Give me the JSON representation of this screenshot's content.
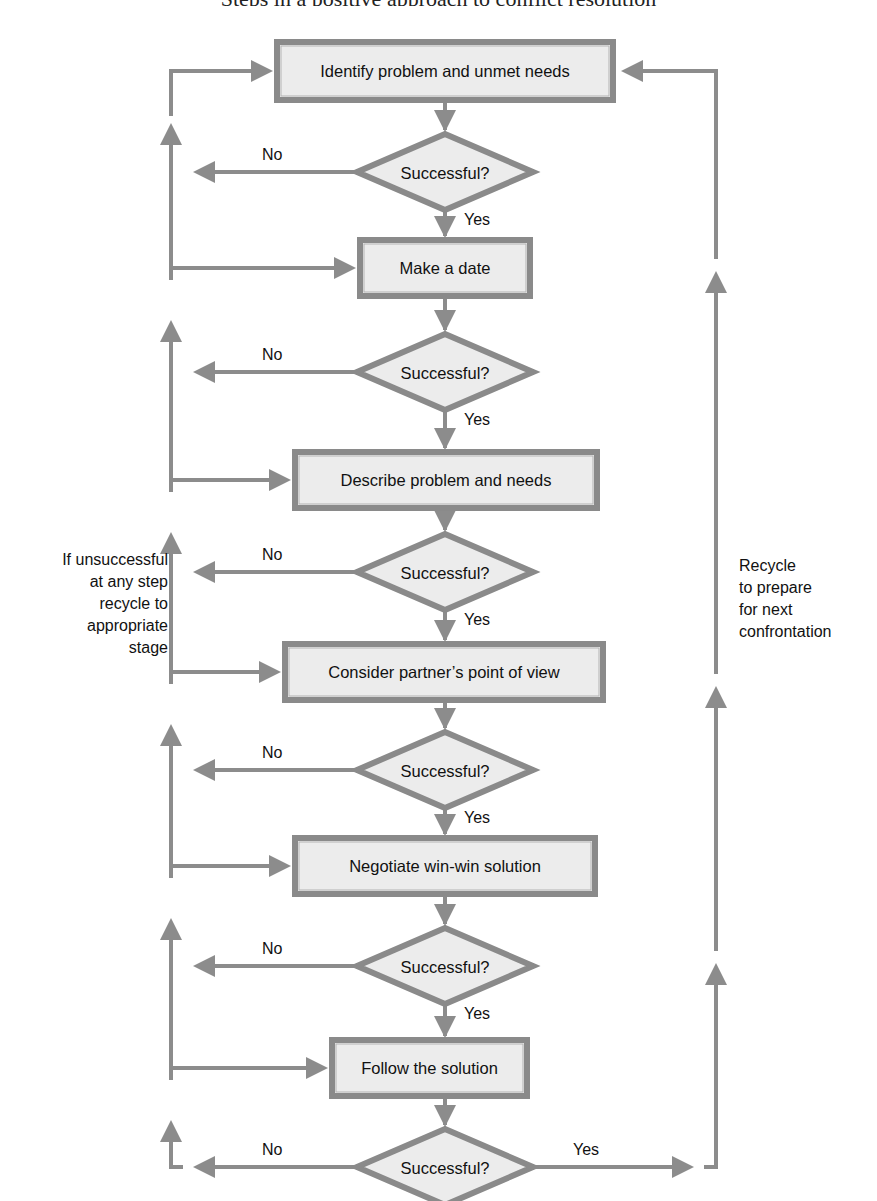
{
  "colors": {
    "box_fill": "#ececec",
    "box_border": "#8a8a8a",
    "connector": "#8c8c8c",
    "text": "#111111",
    "background": "#ffffff"
  },
  "caption_fragment": "Steps in a positive approach to conflict resolution",
  "steps": [
    {
      "id": "identify",
      "label": "Identify problem and unmet needs",
      "x": 277,
      "y": 42,
      "w": 336,
      "h": 58
    },
    {
      "id": "date",
      "label": "Make a date",
      "x": 360,
      "y": 240,
      "w": 170,
      "h": 56
    },
    {
      "id": "describe",
      "label": "Describe problem and needs",
      "x": 295,
      "y": 452,
      "w": 302,
      "h": 56
    },
    {
      "id": "consider",
      "label": "Consider partner’s point of view",
      "x": 285,
      "y": 644,
      "w": 318,
      "h": 56
    },
    {
      "id": "negotiate",
      "label": "Negotiate win-win solution",
      "x": 295,
      "y": 838,
      "w": 300,
      "h": 56
    },
    {
      "id": "follow",
      "label": "Follow the solution",
      "x": 332,
      "y": 1040,
      "w": 195,
      "h": 56
    }
  ],
  "decisions": [
    {
      "label": "Successful?",
      "cx": 445,
      "cy": 172,
      "no_label": "No",
      "yes_label": "Yes"
    },
    {
      "label": "Successful?",
      "cx": 445,
      "cy": 372,
      "no_label": "No",
      "yes_label": "Yes"
    },
    {
      "label": "Successful?",
      "cx": 445,
      "cy": 572,
      "no_label": "No",
      "yes_label": "Yes"
    },
    {
      "label": "Successful?",
      "cx": 445,
      "cy": 770,
      "no_label": "No",
      "yes_label": "Yes"
    },
    {
      "label": "Successful?",
      "cx": 445,
      "cy": 966,
      "no_label": "No",
      "yes_label": "Yes"
    },
    {
      "label": "Successful?",
      "cx": 445,
      "cy": 1167,
      "no_label": "No",
      "yes_label": "Yes"
    }
  ],
  "notes": {
    "left": [
      "If unsuccessful",
      "at any step",
      "recycle to",
      "appropriate",
      "stage"
    ],
    "right": [
      "Recycle",
      "to  prepare",
      "for next",
      "confrontation"
    ]
  },
  "rails": {
    "left_x": 171,
    "right_x": 716
  }
}
